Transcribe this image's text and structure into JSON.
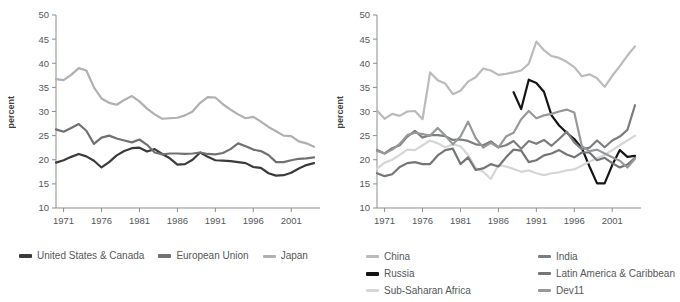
{
  "figure": {
    "axis_title": "percent",
    "y_ticks": [
      10,
      15,
      20,
      25,
      30,
      35,
      40,
      45,
      50
    ],
    "x_ticks": [
      1971,
      1976,
      1981,
      1986,
      1991,
      1996,
      2001
    ]
  },
  "chart_data": [
    {
      "panel": "left",
      "type": "line",
      "title": "",
      "xlabel": "",
      "ylabel": "percent",
      "xlim": [
        1970,
        2004
      ],
      "ylim": [
        10,
        50
      ],
      "grid": false,
      "legend_position": "bottom",
      "x": [
        1970,
        1971,
        1972,
        1973,
        1974,
        1975,
        1976,
        1977,
        1978,
        1979,
        1980,
        1981,
        1982,
        1983,
        1984,
        1985,
        1986,
        1987,
        1988,
        1989,
        1990,
        1991,
        1992,
        1993,
        1994,
        1995,
        1996,
        1997,
        1998,
        1999,
        2000,
        2001,
        2002,
        2003,
        2004
      ],
      "series": [
        {
          "name": "United States & Canada",
          "color": "#3b3b3b",
          "values": [
            19.4,
            19.9,
            20.6,
            21.2,
            20.7,
            19.8,
            18.4,
            19.5,
            20.9,
            21.8,
            22.4,
            22.5,
            21.7,
            22.2,
            21.2,
            20.3,
            19.0,
            19.1,
            20.0,
            21.5,
            20.6,
            19.9,
            19.8,
            19.7,
            19.5,
            19.3,
            18.5,
            18.3,
            17.2,
            16.7,
            16.8,
            17.3,
            18.2,
            18.9,
            19.3
          ]
        },
        {
          "name": "European Union",
          "color": "#6f7173",
          "values": [
            26.3,
            25.8,
            26.6,
            27.4,
            26.0,
            23.3,
            24.6,
            25.0,
            24.4,
            24.0,
            23.6,
            24.2,
            23.1,
            21.5,
            21.1,
            21.3,
            21.3,
            21.2,
            21.3,
            21.5,
            21.2,
            21.1,
            21.4,
            22.2,
            23.4,
            22.8,
            22.1,
            21.8,
            21.0,
            19.5,
            19.5,
            19.9,
            20.2,
            20.3,
            20.5
          ]
        },
        {
          "name": "Japan",
          "color": "#aeb0b1",
          "values": [
            36.7,
            36.5,
            37.6,
            39.0,
            38.5,
            35.0,
            32.7,
            31.8,
            31.4,
            32.4,
            33.2,
            32.1,
            30.6,
            29.4,
            28.5,
            28.6,
            28.7,
            29.2,
            30.0,
            31.8,
            33.0,
            32.9,
            31.5,
            30.4,
            29.4,
            28.6,
            28.9,
            27.9,
            26.8,
            25.9,
            25.0,
            24.9,
            23.8,
            23.4,
            22.7
          ]
        }
      ]
    },
    {
      "panel": "right",
      "type": "line",
      "title": "",
      "xlabel": "",
      "ylabel": "percent",
      "xlim": [
        1970,
        2004
      ],
      "ylim": [
        10,
        50
      ],
      "grid": false,
      "legend_position": "bottom",
      "x": [
        1970,
        1971,
        1972,
        1973,
        1974,
        1975,
        1976,
        1977,
        1978,
        1979,
        1980,
        1981,
        1982,
        1983,
        1984,
        1985,
        1986,
        1987,
        1988,
        1989,
        1990,
        1991,
        1992,
        1993,
        1994,
        1995,
        1996,
        1997,
        1998,
        1999,
        2000,
        2001,
        2002,
        2003,
        2004
      ],
      "series": [
        {
          "name": "China",
          "color": "#b9bbbc",
          "values": [
            30.2,
            28.5,
            29.5,
            29.1,
            30.0,
            30.1,
            28.4,
            38.1,
            36.5,
            35.8,
            33.6,
            34.3,
            36.2,
            37.1,
            38.9,
            38.5,
            37.6,
            37.8,
            38.1,
            38.5,
            39.9,
            44.5,
            42.7,
            41.5,
            41.1,
            40.3,
            39.2,
            37.3,
            37.7,
            36.9,
            35.1,
            37.4,
            39.4,
            41.6,
            43.5
          ]
        },
        {
          "name": "Russia",
          "color": "#151515",
          "values": [
            null,
            null,
            null,
            null,
            null,
            null,
            null,
            null,
            null,
            null,
            null,
            null,
            null,
            null,
            null,
            null,
            null,
            null,
            34.0,
            30.5,
            36.6,
            35.9,
            34.1,
            29.2,
            27.1,
            25.6,
            24.3,
            22.4,
            18.6,
            15.1,
            15.1,
            18.9,
            22.0,
            20.6,
            20.8
          ]
        },
        {
          "name": "Sub-Saharan Africa",
          "color": "#d4d6d7",
          "values": [
            18.1,
            19.4,
            20.0,
            21.0,
            22.1,
            22.0,
            23.0,
            24.0,
            23.4,
            22.6,
            23.2,
            22.8,
            21.0,
            18.3,
            17.5,
            16.0,
            18.9,
            18.6,
            18.1,
            17.5,
            17.8,
            17.2,
            16.8,
            17.2,
            17.4,
            17.8,
            18.0,
            18.8,
            19.6,
            20.3,
            21.0,
            22.0,
            23.0,
            24.0,
            25.0
          ]
        },
        {
          "name": "India",
          "color": "#7b7d7e",
          "values": [
            22.0,
            21.3,
            22.4,
            23.0,
            24.8,
            26.0,
            24.6,
            25.1,
            25.1,
            24.9,
            24.1,
            24.2,
            23.9,
            23.2,
            23.0,
            23.8,
            22.6,
            23.0,
            23.9,
            22.3,
            23.9,
            23.3,
            24.1,
            22.9,
            24.3,
            25.8,
            23.6,
            22.2,
            22.5,
            24.0,
            22.6,
            24.0,
            24.8,
            26.2,
            31.3
          ]
        },
        {
          "name": "Latin America & Caribbean",
          "color": "#737577",
          "values": [
            17.2,
            16.6,
            17.0,
            18.5,
            19.3,
            19.5,
            19.1,
            19.1,
            20.9,
            22.0,
            22.3,
            19.1,
            20.5,
            17.9,
            18.2,
            19.1,
            18.6,
            20.5,
            22.1,
            21.9,
            19.5,
            19.9,
            20.9,
            21.3,
            22.0,
            21.1,
            20.5,
            21.5,
            21.5,
            19.9,
            20.4,
            19.3,
            18.4,
            19.0,
            20.4
          ]
        },
        {
          "name": "Dev11",
          "color": "#96989a",
          "values": [
            21.8,
            21.3,
            22.1,
            23.3,
            25.1,
            25.6,
            25.3,
            25.0,
            26.6,
            25.0,
            23.2,
            24.8,
            27.9,
            24.5,
            22.5,
            23.5,
            22.5,
            24.8,
            25.6,
            28.4,
            30.1,
            28.6,
            29.2,
            29.5,
            30.0,
            30.4,
            29.8,
            22.8,
            21.8,
            22.1,
            21.3,
            20.5,
            19.8,
            18.4,
            20.2
          ]
        }
      ]
    }
  ],
  "legend_left": {
    "items": [
      {
        "label": "United States & Canada",
        "color": "#3b3b3b",
        "thick": true
      },
      {
        "label": "European Union",
        "color": "#6f7173",
        "thick": true
      },
      {
        "label": "Japan",
        "color": "#aeb0b1",
        "thick": false
      }
    ]
  },
  "legend_right": {
    "items": [
      {
        "label": "China",
        "color": "#b9bbbc",
        "thick": false
      },
      {
        "label": "India",
        "color": "#7b7d7e",
        "thick": false
      },
      {
        "label": "Russia",
        "color": "#151515",
        "thick": true
      },
      {
        "label": "Latin America & Caribbean",
        "color": "#737577",
        "thick": false
      },
      {
        "label": "Sub-Saharan Africa",
        "color": "#d4d6d7",
        "thick": false
      },
      {
        "label": "Dev11",
        "color": "#96989a",
        "thick": false
      }
    ]
  }
}
